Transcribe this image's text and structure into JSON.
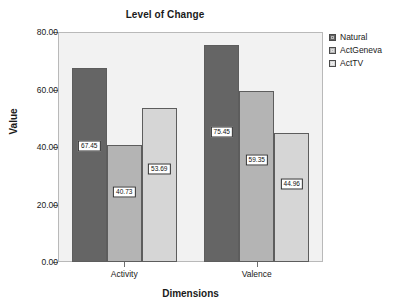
{
  "chart_data": {
    "type": "bar",
    "title": "Level of Change",
    "xlabel": "Dimensions",
    "ylabel": "Value",
    "categories": [
      "Activity",
      "Valence"
    ],
    "series": [
      {
        "name": "Natural",
        "color": "#656565",
        "values": [
          67.45,
          75.45
        ],
        "labels": [
          "67.45",
          "75.45"
        ]
      },
      {
        "name": "ActGeneva",
        "color": "#b4b4b4",
        "values": [
          40.73,
          59.35
        ],
        "labels": [
          "40.73",
          "59.35"
        ]
      },
      {
        "name": "ActTV",
        "color": "#d6d6d6",
        "values": [
          53.69,
          44.96
        ],
        "labels": [
          "53.69",
          "44.96"
        ]
      }
    ],
    "ylim": [
      0,
      80
    ],
    "yticks": [
      0,
      20,
      40,
      60,
      80
    ],
    "ytick_labels": [
      "0.00",
      "20.00",
      "40.00",
      "60.00",
      "80.00"
    ],
    "grid": false,
    "legend_position": "right",
    "plot_background": "#f2f2f2",
    "axis_color": "#6e6e6e"
  },
  "legend": {
    "entries": [
      {
        "label": "Natural"
      },
      {
        "label": "ActGeneva"
      },
      {
        "label": "ActTV"
      }
    ]
  }
}
